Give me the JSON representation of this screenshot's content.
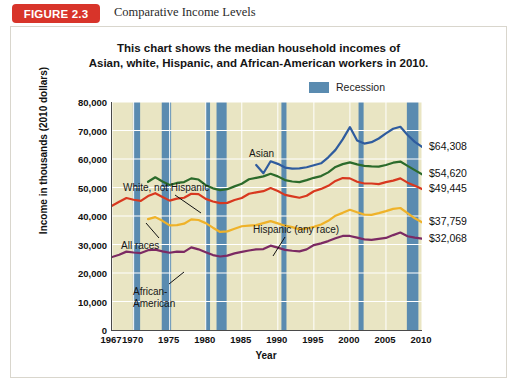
{
  "figure": {
    "badge": "FIGURE 2.3",
    "caption": "Comparative Income Levels"
  },
  "chart_title_line1": "This chart shows the median household incomes of",
  "chart_title_line2": "Asian, white, Hispanic, and African-American workers in 2010.",
  "legend": {
    "recession_label": "Recession",
    "recession_color": "#5a8bb0"
  },
  "axes": {
    "ylabel": "Income in thousands (2010 dollars)",
    "xlabel": "Year",
    "yticks": [
      "0",
      "10,000",
      "20,000",
      "30,000",
      "40,000",
      "50,000",
      "60,000",
      "70,000",
      "80,000"
    ],
    "xticks": [
      "1967",
      "1970",
      "1975",
      "1980",
      "1985",
      "1990",
      "1995",
      "2000",
      "2005",
      "2010"
    ]
  },
  "annotations": {
    "asian": "Asian",
    "white": "White, not Hispanic",
    "all_races": "All races",
    "hispanic": "Hispanic (any race)",
    "african_american_l1": "African-",
    "african_american_l2": "American"
  },
  "end_labels": {
    "asian": "$64,308",
    "white": "$54,620",
    "all_races": "$49,445",
    "hispanic": "$37,759",
    "african_american": "$32,068"
  },
  "chart_data": {
    "type": "line",
    "title": "This chart shows the median household incomes of Asian, white, Hispanic, and African-American workers in 2010.",
    "xlabel": "Year",
    "ylabel": "Income in thousands (2010 dollars)",
    "xlim": [
      1967,
      2010
    ],
    "ylim": [
      0,
      80000
    ],
    "ytick_step": 10000,
    "grid": true,
    "legend_position": "top-right",
    "plot_bg": "#e9e5c3",
    "recession_color": "#5a8bb0",
    "recession_bands": [
      [
        1969.9,
        1970.9
      ],
      [
        1973.9,
        1975.2
      ],
      [
        1980.0,
        1980.6
      ],
      [
        1981.5,
        1982.9
      ],
      [
        1990.5,
        1991.2
      ],
      [
        2001.2,
        2001.9
      ],
      [
        2007.9,
        2009.5
      ]
    ],
    "series": [
      {
        "name": "Asian",
        "color": "#2f5c9e",
        "end_value": 64308,
        "x": [
          1987,
          1988,
          1989,
          1990,
          1991,
          1992,
          1993,
          1994,
          1995,
          1996,
          1997,
          1998,
          1999,
          2000,
          2001,
          2002,
          2003,
          2004,
          2005,
          2006,
          2007,
          2008,
          2009,
          2010
        ],
        "values": [
          57900,
          55000,
          59200,
          58300,
          57000,
          56600,
          56700,
          57100,
          57800,
          58500,
          60600,
          63200,
          66900,
          71200,
          66500,
          65400,
          65900,
          67200,
          69000,
          70600,
          71300,
          68400,
          66000,
          64308
        ]
      },
      {
        "name": "White, not Hispanic",
        "color": "#2c6b2b",
        "end_value": 54620,
        "x": [
          1972,
          1973,
          1974,
          1975,
          1976,
          1977,
          1978,
          1979,
          1980,
          1981,
          1982,
          1983,
          1984,
          1985,
          1986,
          1987,
          1988,
          1989,
          1990,
          1991,
          1992,
          1993,
          1994,
          1995,
          1996,
          1997,
          1998,
          1999,
          2000,
          2001,
          2002,
          2003,
          2004,
          2005,
          2006,
          2007,
          2008,
          2009,
          2010
        ],
        "values": [
          52000,
          53600,
          52100,
          50900,
          51600,
          51900,
          53200,
          52800,
          50800,
          49700,
          49100,
          49400,
          50400,
          51300,
          52900,
          53400,
          53900,
          54800,
          53900,
          52600,
          52100,
          51900,
          52600,
          53400,
          54000,
          55300,
          57200,
          58200,
          58800,
          58100,
          57600,
          57400,
          57300,
          57900,
          58700,
          59100,
          57600,
          56100,
          54620
        ]
      },
      {
        "name": "All races",
        "color": "#d8381f",
        "end_value": 49445,
        "x": [
          1967,
          1968,
          1969,
          1970,
          1971,
          1972,
          1973,
          1974,
          1975,
          1976,
          1977,
          1978,
          1979,
          1980,
          1981,
          1982,
          1983,
          1984,
          1985,
          1986,
          1987,
          1988,
          1989,
          1990,
          1991,
          1992,
          1993,
          1994,
          1995,
          1996,
          1997,
          1998,
          1999,
          2000,
          2001,
          2002,
          2003,
          2004,
          2005,
          2006,
          2007,
          2008,
          2009,
          2010
        ],
        "values": [
          43600,
          45000,
          46300,
          45700,
          45300,
          47000,
          48000,
          46700,
          45400,
          46100,
          46400,
          47800,
          47700,
          46000,
          45100,
          44500,
          44600,
          45600,
          46300,
          47800,
          48300,
          48700,
          49800,
          48800,
          47400,
          46900,
          46400,
          47100,
          48700,
          49500,
          50600,
          52300,
          53300,
          53200,
          52000,
          51400,
          51400,
          51200,
          51900,
          52400,
          53200,
          51700,
          50600,
          49445
        ]
      },
      {
        "name": "Hispanic (any race)",
        "color": "#efb229",
        "end_value": 37759,
        "x": [
          1972,
          1973,
          1974,
          1975,
          1976,
          1977,
          1978,
          1979,
          1980,
          1981,
          1982,
          1983,
          1984,
          1985,
          1986,
          1987,
          1988,
          1989,
          1990,
          1991,
          1992,
          1993,
          1994,
          1995,
          1996,
          1997,
          1998,
          1999,
          2000,
          2001,
          2002,
          2003,
          2004,
          2005,
          2006,
          2007,
          2008,
          2009,
          2010
        ],
        "values": [
          38900,
          39600,
          38300,
          36700,
          36800,
          37300,
          38800,
          38600,
          37500,
          35900,
          34400,
          34600,
          35500,
          36400,
          36600,
          36800,
          37500,
          38200,
          37400,
          36600,
          36100,
          35300,
          35600,
          36200,
          37000,
          38300,
          40100,
          41100,
          42200,
          41300,
          40500,
          40400,
          41000,
          41700,
          42500,
          42800,
          41000,
          39200,
          37759
        ]
      },
      {
        "name": "African-American",
        "color": "#7c2a63",
        "end_value": 32068,
        "x": [
          1967,
          1968,
          1969,
          1970,
          1971,
          1972,
          1973,
          1974,
          1975,
          1976,
          1977,
          1978,
          1979,
          1980,
          1981,
          1982,
          1983,
          1984,
          1985,
          1986,
          1987,
          1988,
          1989,
          1990,
          1991,
          1992,
          1993,
          1994,
          1995,
          1996,
          1997,
          1998,
          1999,
          2000,
          2001,
          2002,
          2003,
          2004,
          2005,
          2006,
          2007,
          2008,
          2009,
          2010
        ],
        "values": [
          25600,
          26400,
          27500,
          27200,
          27000,
          28000,
          28200,
          27600,
          27100,
          27500,
          27400,
          29000,
          28300,
          27300,
          26300,
          25800,
          26100,
          26900,
          27400,
          27900,
          28300,
          28400,
          29600,
          28900,
          28100,
          27800,
          27600,
          28300,
          29800,
          30400,
          31200,
          32200,
          33000,
          33000,
          32400,
          31800,
          31600,
          32000,
          32300,
          33300,
          34200,
          32900,
          32400,
          32068
        ]
      }
    ]
  }
}
